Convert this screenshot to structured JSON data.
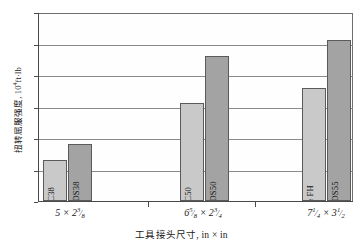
{
  "chart_data": {
    "type": "bar",
    "title": "",
    "xlabel": "工具接头尺寸, in × in",
    "ylabel": "扭转屈服强度, 10⁴ft·lb",
    "ylabel_base": "扭转屈服强度,  10",
    "ylabel_exp": "4",
    "ylabel_unit": "ft·lb",
    "ylim": [
      0,
      12
    ],
    "yticks": [
      0,
      2,
      4,
      6,
      8,
      10,
      12
    ],
    "ytick_labels": [
      "0",
      "2",
      "4",
      "6",
      "8",
      "10",
      "12"
    ],
    "grid": true,
    "legend": "none",
    "categories": [
      "5 × 2⅜",
      "6⅝ × 2¾",
      "7¼ × 3½"
    ],
    "series": [
      {
        "name": "标准接头",
        "color": "#c9c9c9",
        "point_labels": [
          "NC38",
          "NC50",
          "5½ FH"
        ],
        "values": [
          2.6,
          6.25,
          7.15
        ]
      },
      {
        "name": "BGDS接头",
        "color": "#a3a3a3",
        "point_labels": [
          "BGDS38",
          "BGDS50",
          "BGDS55"
        ],
        "values": [
          3.65,
          9.2,
          10.25
        ]
      }
    ]
  },
  "axis": {
    "y_ticks": [
      {
        "value": 12,
        "label": "12"
      },
      {
        "value": 10,
        "label": "10"
      },
      {
        "value": 8,
        "label": "8"
      },
      {
        "value": 6,
        "label": "6"
      },
      {
        "value": 4,
        "label": "4"
      },
      {
        "value": 2,
        "label": "2"
      },
      {
        "value": 0,
        "label": "0"
      }
    ],
    "x_categories": [
      {
        "whole_a": "5",
        "frac_a_num": "",
        "frac_a_den": "",
        "whole_b": "2",
        "frac_b_num": "3",
        "frac_b_den": "8"
      },
      {
        "whole_a": "6",
        "frac_a_num": "5",
        "frac_a_den": "8",
        "whole_b": "2",
        "frac_b_num": "3",
        "frac_b_den": "4"
      },
      {
        "whole_a": "7",
        "frac_a_num": "1",
        "frac_a_den": "4",
        "whole_b": "3",
        "frac_b_num": "1",
        "frac_b_den": "2"
      }
    ],
    "times_symbol": "×"
  },
  "bars": [
    {
      "label": "NC38",
      "value": 2.6,
      "group": 0,
      "series": 0
    },
    {
      "label": "BGDS38",
      "value": 3.65,
      "group": 0,
      "series": 1
    },
    {
      "label": "NC50",
      "value": 6.25,
      "group": 1,
      "series": 0
    },
    {
      "label": "BGDS50",
      "value": 9.2,
      "group": 1,
      "series": 1
    },
    {
      "label": "5½ FH",
      "value": 7.15,
      "group": 2,
      "series": 0
    },
    {
      "label": "BGDS55",
      "value": 10.25,
      "group": 2,
      "series": 1
    }
  ],
  "colors": {
    "series_light": "#c9c9c9",
    "series_dark": "#a3a3a3",
    "axis": "#4a4a4a",
    "grid": "#8a8a8a",
    "text": "#1a1a1a"
  }
}
